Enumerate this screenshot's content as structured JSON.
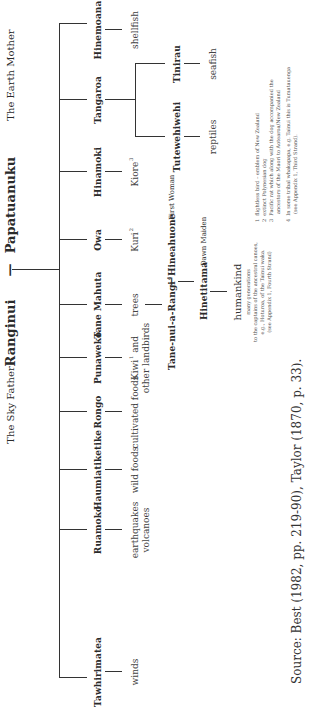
{
  "diagram": {
    "parents": {
      "father": {
        "name": "Ranginui",
        "epithet": "The Sky Father"
      },
      "connector": "—",
      "mother": {
        "name": "Papatuanuku",
        "epithet": "The Earth Mother"
      }
    },
    "children": [
      {
        "name": "Tawhirimatea",
        "domain_lines": [
          "winds"
        ]
      },
      {
        "name": "Ruamoko",
        "domain_lines": [
          "earthquakes",
          "volcanoes"
        ]
      },
      {
        "name": "Haumiatiketike",
        "domain_lines": [
          "wild foods"
        ]
      },
      {
        "name": "Rongo",
        "domain_lines": [
          "cultivated foods"
        ]
      },
      {
        "name": "Punaweko",
        "domain_lines": [
          "Kiwi",
          "other landbirds"
        ],
        "domain_sup": "1",
        "domain_first_suffix": " and"
      },
      {
        "name": "Tane Mahuta",
        "domain_lines": [
          "trees"
        ]
      },
      {
        "name": "Owa",
        "domain_lines": [
          "Kuri"
        ],
        "domain_sup": "2"
      },
      {
        "name": "Hinamoki",
        "domain_lines": [
          "Kiore"
        ],
        "domain_sup": "3"
      },
      {
        "name": "Tangaroa",
        "sub_children": [
          {
            "name": "Tutewehiwehi",
            "domain": "reptiles"
          },
          {
            "name": "Tinirau",
            "domain": "seafish"
          }
        ]
      },
      {
        "name": "Hinemoana",
        "domain_lines": [
          "shellfish"
        ]
      }
    ],
    "tane_line": {
      "father": {
        "name": "Tane-nui-a-Rangi",
        "sup": "4"
      },
      "connector": "—",
      "mother": {
        "name": "Hineahuone",
        "epithet": "First Woman"
      },
      "daughter": {
        "name": "Hinetitama",
        "epithet": "Dawn Maiden"
      },
      "descendants": {
        "title": "humankind",
        "lines": [
          "many generations",
          "to the captains of the ancestral canoes,",
          "e.g., Hoturoa, of the Tainui waka.",
          "(see Appendix 1, Fourth Strand)"
        ]
      }
    },
    "footnotes": [
      {
        "num": "1",
        "lines": [
          "flightless bird – emblem of New Zealand"
        ]
      },
      {
        "num": "2",
        "lines": [
          "extinct Polynesian dog"
        ]
      },
      {
        "num": "3",
        "lines": [
          "Pacific rat which along with the dog accompanied the",
          "ancestors of the Maori to Aotearoa/New Zealand"
        ]
      },
      {
        "num": "4",
        "lines": [
          "In some tribal whakapapa, e.g. Tainui this is Tumatauenga",
          "(see Appendix 1, Third Strand)."
        ]
      }
    ],
    "source": "Source: Best (1982, pp. 219-90), Taylor (1870, p. 33)."
  }
}
